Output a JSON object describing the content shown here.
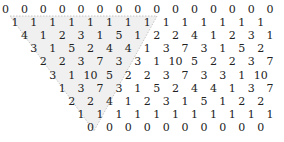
{
  "figure": {
    "shading_color": "#f0f0f0",
    "border_color": "#b8b8b8",
    "rows": [
      {
        "offset": 0,
        "values": [
          "0",
          "0",
          "0",
          "0",
          "0",
          "0",
          "0",
          "0",
          "0",
          "0",
          "0",
          "0",
          "0",
          "0",
          "0"
        ]
      },
      {
        "offset": 1,
        "values": [
          "1",
          "1",
          "1",
          "1",
          "1",
          "1",
          "1",
          "1",
          "1",
          "1",
          "1",
          "1",
          "1",
          "1"
        ]
      },
      {
        "offset": 2,
        "values": [
          "4",
          "1",
          "2",
          "3",
          "1",
          "5",
          "1",
          "2",
          "2",
          "4",
          "1",
          "2",
          "3",
          "1"
        ]
      },
      {
        "offset": 3,
        "values": [
          "3",
          "1",
          "5",
          "2",
          "4",
          "4",
          "1",
          "3",
          "7",
          "3",
          "1",
          "5",
          "2"
        ]
      },
      {
        "offset": 4,
        "values": [
          "2",
          "2",
          "3",
          "7",
          "3",
          "3",
          "1",
          "10",
          "5",
          "2",
          "2",
          "3",
          "7"
        ]
      },
      {
        "offset": 5,
        "values": [
          "3",
          "1",
          "10",
          "5",
          "2",
          "2",
          "3",
          "7",
          "3",
          "3",
          "1",
          "10"
        ]
      },
      {
        "offset": 6,
        "values": [
          "1",
          "3",
          "7",
          "3",
          "1",
          "5",
          "2",
          "4",
          "4",
          "1",
          "3",
          "7"
        ]
      },
      {
        "offset": 7,
        "values": [
          "2",
          "2",
          "4",
          "1",
          "2",
          "3",
          "1",
          "5",
          "1",
          "2",
          "2"
        ]
      },
      {
        "offset": 8,
        "values": [
          "1",
          "1",
          "1",
          "1",
          "1",
          "1",
          "1",
          "1",
          "1",
          "1",
          "1"
        ]
      },
      {
        "offset": 9,
        "values": [
          "0",
          "0",
          "0",
          "0",
          "0",
          "0",
          "0",
          "0",
          "0",
          "0"
        ]
      }
    ]
  }
}
